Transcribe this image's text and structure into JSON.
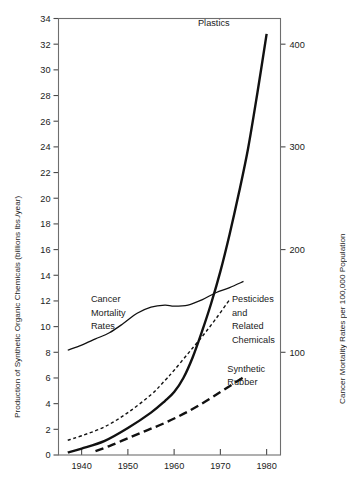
{
  "chart_data": {
    "type": "line",
    "title": "",
    "xlabel": "",
    "ylabel": "Production of Synthetic Organic Chemicals (billions lbs./year)",
    "y2label": "Cancer Mortality Rates per 100,000 Population",
    "xlim": [
      1935,
      1983
    ],
    "ylim": [
      0,
      34
    ],
    "y2lim": [
      0,
      425
    ],
    "xticks": [
      1940,
      1950,
      1960,
      1970,
      1980
    ],
    "xticklabels": [
      "1940",
      "1950",
      "1960",
      "1970",
      "1980"
    ],
    "yticks": [
      0,
      2,
      4,
      6,
      8,
      10,
      12,
      14,
      16,
      18,
      20,
      22,
      24,
      26,
      28,
      30,
      32,
      34
    ],
    "yticklabels": [
      "0",
      "2",
      "4",
      "6",
      "8",
      "10",
      "12",
      "14",
      "16",
      "18",
      "20",
      "22",
      "24",
      "26",
      "28",
      "30",
      "32",
      "34"
    ],
    "y2ticks": [
      100,
      200,
      300,
      400
    ],
    "y2ticklabels": [
      "100",
      "200",
      "300",
      "400"
    ],
    "grid": false,
    "legend": "inline-annotations",
    "series": [
      {
        "name": "Plastics",
        "axis": "left",
        "style": "solid",
        "width": 2.4,
        "color": "#111111",
        "x": [
          1937,
          1940,
          1945,
          1950,
          1955,
          1958,
          1960,
          1962,
          1964,
          1966,
          1968,
          1970,
          1972,
          1974,
          1976,
          1978,
          1980
        ],
        "y": [
          0.2,
          0.5,
          1.1,
          2.1,
          3.3,
          4.2,
          4.9,
          6.0,
          7.6,
          9.6,
          11.8,
          14.3,
          17.2,
          20.4,
          23.9,
          28.2,
          32.8
        ]
      },
      {
        "name": "Cancer Mortality Rates",
        "axis": "right",
        "style": "solid",
        "width": 1.3,
        "color": "#111111",
        "x": [
          1937,
          1940,
          1943,
          1946,
          1949,
          1952,
          1955,
          1958,
          1960,
          1963,
          1966,
          1969,
          1972,
          1975
        ],
        "y": [
          8.2,
          8.7,
          9.2,
          9.7,
          10.4,
          11.2,
          11.7,
          11.85,
          11.8,
          11.9,
          12.3,
          12.8,
          13.2,
          13.65
        ],
        "y_right": [
          102,
          107,
          113,
          119,
          128,
          138,
          144,
          146,
          145,
          146,
          151,
          158,
          163,
          169
        ]
      },
      {
        "name": "Pesticides and Related Chemicals",
        "axis": "left",
        "style": "short-dash",
        "width": 1.4,
        "color": "#111111",
        "x": [
          1937,
          1940,
          1945,
          1950,
          1955,
          1958,
          1960,
          1963,
          1966,
          1969,
          1972
        ],
        "y": [
          1.15,
          1.5,
          2.2,
          3.3,
          4.7,
          5.8,
          6.6,
          7.9,
          9.2,
          10.6,
          12.1
        ]
      },
      {
        "name": "Synthetic Rubber",
        "axis": "left",
        "style": "long-dash",
        "width": 2.4,
        "color": "#111111",
        "x": [
          1943,
          1946,
          1950,
          1954,
          1958,
          1962,
          1966,
          1970,
          1973,
          1975
        ],
        "y": [
          0.3,
          0.7,
          1.3,
          1.9,
          2.5,
          3.2,
          4.0,
          4.9,
          5.6,
          6.05
        ]
      }
    ],
    "annotations": [
      {
        "text": "Plastics",
        "x": 1972,
        "y": 33.4
      },
      {
        "text": "Cancer",
        "x": 1942,
        "y": 11.9
      },
      {
        "text": "Mortality",
        "x": 1942,
        "y": 10.85
      },
      {
        "text": "Rates",
        "x": 1942,
        "y": 9.8
      },
      {
        "text": "Pesticides",
        "x": 1972.5,
        "y": 11.9
      },
      {
        "text": "and",
        "x": 1972.5,
        "y": 10.85
      },
      {
        "text": "Related",
        "x": 1972.5,
        "y": 9.8
      },
      {
        "text": "Chemicals",
        "x": 1972.5,
        "y": 8.75
      },
      {
        "text": "Synthetic",
        "x": 1971.5,
        "y": 6.5
      },
      {
        "text": "Rubber",
        "x": 1971.5,
        "y": 5.45
      }
    ]
  },
  "figure": {
    "left_axis_title": "Production of Synthetic Organic Chemicals (billions lbs./year)",
    "right_axis_title": "Cancer Mortality Rates per 100,000 Population",
    "frame_color": "#6e6e6e",
    "background": "#ffffff",
    "ink_color": "#111111"
  }
}
